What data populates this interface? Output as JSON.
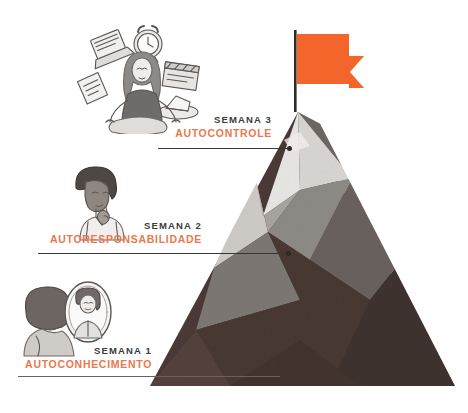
{
  "diagram": {
    "colors": {
      "flag": "#f4652b",
      "flag_pole": "#2f2b29",
      "peak_snow": "#e6e4e2",
      "facet_light": "#d7d4d1",
      "facet_mid": "#8e8b87",
      "facet_mid_dark": "#6a625e",
      "facet_dark": "#4a3a36",
      "facet_darkest": "#3f322e",
      "week_text": "#3b3b3b",
      "topic_text": "#e8794e",
      "leader_line": "#3a3634",
      "background": "#ffffff"
    },
    "steps": [
      {
        "week": "SEMANA 1",
        "topic": "AUTOCONHECIMENTO",
        "illustration": "person-looking-in-mirror-sketch"
      },
      {
        "week": "SEMANA 2",
        "topic": "AUTORESPONSABILIDADE",
        "illustration": "pensive-person-hand-on-chin-sketch"
      },
      {
        "week": "SEMANA 3",
        "topic": "AUTOCONTROLE",
        "illustration": "woman-meditating-lotus-with-floating-objects-sketch"
      }
    ],
    "summit": {
      "icon": "flag-icon",
      "description": "Bandeira laranja no cume"
    }
  }
}
